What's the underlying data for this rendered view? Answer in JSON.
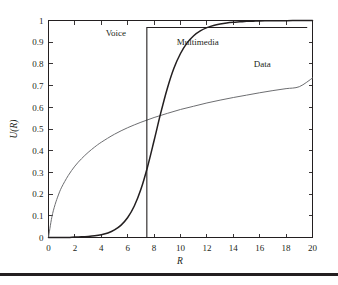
{
  "chart_data": {
    "type": "line",
    "title": "",
    "xlabel": "R",
    "ylabel": "U(R)",
    "xlim": [
      0,
      20
    ],
    "ylim": [
      0,
      1
    ],
    "grid": false,
    "legend_position": "inline-annotations",
    "xticks": [
      "0",
      "2",
      "4",
      "6",
      "8",
      "10",
      "12",
      "14",
      "16",
      "18",
      "20"
    ],
    "xtick_values": [
      0,
      2,
      4,
      6,
      8,
      10,
      12,
      14,
      16,
      18,
      20
    ],
    "yticks": [
      "0",
      "0.1",
      "0.2",
      "0.3",
      "0.4",
      "0.5",
      "0.6",
      "0.7",
      "0.8",
      "0.9",
      "1"
    ],
    "ytick_values": [
      0,
      0.1,
      0.2,
      0.3,
      0.4,
      0.5,
      0.6,
      0.7,
      0.8,
      0.9,
      1
    ],
    "annotations": [
      {
        "text": "Voice",
        "x": 5.1,
        "y": 0.93
      },
      {
        "text": "Multimedia",
        "x": 11.3,
        "y": 0.885
      },
      {
        "text": "Data",
        "x": 16.2,
        "y": 0.785
      }
    ],
    "series": [
      {
        "name": "Voice",
        "style": "step",
        "color": "#231f20",
        "description": "Hard step utility: 0 below R=7.45, 0.97 above",
        "x": [
          0,
          7.45,
          7.45,
          19.6
        ],
        "values": [
          0,
          0,
          0.968,
          0.968
        ]
      },
      {
        "name": "Multimedia",
        "style": "sigmoid",
        "color": "#231f20",
        "description": "Sigmoid utility rising sharply between R=5 and R=12",
        "x": [
          0,
          0.5,
          1,
          1.5,
          2,
          2.5,
          3,
          3.5,
          4,
          4.5,
          5,
          5.5,
          6,
          6.5,
          7,
          7.5,
          8,
          8.5,
          9,
          9.5,
          10,
          10.5,
          11,
          11.5,
          12,
          12.5,
          13,
          13.5,
          14,
          14.5,
          15,
          15.5,
          16,
          16.5,
          17,
          17.5,
          18,
          18.5,
          19,
          19.5,
          20
        ],
        "values": [
          0,
          0,
          0,
          0,
          0.002,
          0.003,
          0.005,
          0.008,
          0.013,
          0.021,
          0.035,
          0.057,
          0.092,
          0.145,
          0.222,
          0.325,
          0.447,
          0.573,
          0.687,
          0.78,
          0.848,
          0.897,
          0.93,
          0.952,
          0.967,
          0.977,
          0.984,
          0.989,
          0.992,
          0.994,
          0.996,
          0.997,
          0.998,
          0.9985,
          0.999,
          0.9992,
          0.9994,
          0.9995,
          0.9996,
          0.9997,
          0.9998
        ]
      },
      {
        "name": "Data",
        "style": "logarithmic",
        "color": "#6d6e71",
        "description": "Concave logarithmic utility, diminishing returns",
        "x": [
          0,
          0.25,
          0.5,
          0.75,
          1,
          1.5,
          2,
          2.5,
          3,
          3.5,
          4,
          5,
          6,
          7,
          8,
          9,
          10,
          11,
          12,
          13,
          14,
          15,
          16,
          17,
          18,
          19,
          20
        ],
        "values": [
          0,
          0.093,
          0.152,
          0.196,
          0.232,
          0.286,
          0.329,
          0.363,
          0.392,
          0.417,
          0.439,
          0.476,
          0.506,
          0.531,
          0.553,
          0.572,
          0.59,
          0.605,
          0.62,
          0.633,
          0.645,
          0.656,
          0.667,
          0.677,
          0.686,
          0.695,
          0.735
        ]
      }
    ]
  },
  "figure": {
    "rule_label": "footer-rule"
  }
}
